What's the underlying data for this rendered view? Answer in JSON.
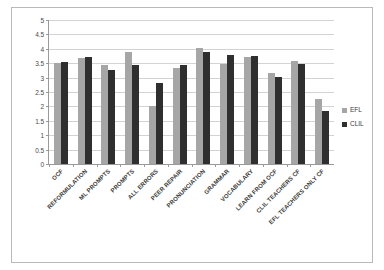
{
  "chart_data": {
    "type": "bar",
    "title": "",
    "subtitle": "",
    "xlabel": "",
    "ylabel": "",
    "ylim": [
      0,
      5
    ],
    "yticks": [
      "0",
      "0.5",
      "1",
      "1.5",
      "2",
      "2.5",
      "3",
      "3.5",
      "4",
      "4.5",
      "5"
    ],
    "ytick_values": [
      0,
      0.5,
      1,
      1.5,
      2,
      2.5,
      3,
      3.5,
      4,
      4.5,
      5
    ],
    "grid": true,
    "legend_position": "right",
    "categories": [
      "OCF",
      "REFORMULATION",
      "ML PROMPTS",
      "PROMPTS",
      "ALL ERRORS",
      "PEER REPAIR",
      "PRONUNCIATION",
      "GRAMMAR",
      "VOCABULARY",
      "LEARN FROM OCF",
      "CLIL TEACHERS CF",
      "EFL TEACHERS ONLY CF"
    ],
    "series": [
      {
        "name": "EFL",
        "color": "#a6a6a6",
        "values": [
          3.5,
          3.68,
          3.43,
          3.88,
          2.0,
          3.35,
          4.02,
          3.46,
          3.7,
          3.17,
          3.57,
          2.25
        ]
      },
      {
        "name": "CLIL",
        "color": "#2f2f2f",
        "values": [
          3.55,
          3.72,
          3.25,
          3.43,
          2.8,
          3.43,
          3.88,
          3.78,
          3.76,
          3.03,
          3.47,
          1.85
        ]
      }
    ]
  },
  "legend": {
    "items": [
      {
        "label": "EFL",
        "color": "#a6a6a6"
      },
      {
        "label": "CLIL",
        "color": "#2f2f2f"
      }
    ]
  },
  "colors": {
    "efl": "#a6a6a6",
    "clil": "#2f2f2f",
    "gridline": "#d3d3d3",
    "axis": "#9a9a9a",
    "border": "#b9b9b9",
    "background": "#ffffff"
  }
}
